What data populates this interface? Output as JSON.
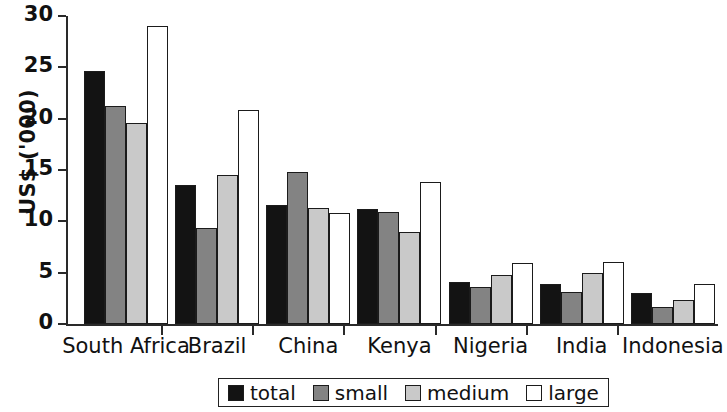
{
  "chart_data": {
    "type": "bar",
    "title": "",
    "subtitle": "",
    "xlabel": "",
    "ylabel": "US$  ('000)",
    "ylim": [
      0,
      30
    ],
    "yticks": [
      0,
      5,
      10,
      15,
      20,
      25,
      30
    ],
    "ytick_labels": [
      "0",
      "5",
      "10",
      "15",
      "20",
      "25",
      "30"
    ],
    "grid": false,
    "legend_position": "bottom-center",
    "categories": [
      "South Africa",
      "Brazil",
      "China",
      "Kenya",
      "Nigeria",
      "India",
      "Indonesia"
    ],
    "series": [
      {
        "name": "total",
        "color": "#131313",
        "values": [
          24.6,
          13.5,
          11.6,
          11.2,
          4.1,
          3.9,
          3.0
        ]
      },
      {
        "name": "small",
        "color": "#838383",
        "values": [
          21.2,
          9.4,
          14.8,
          10.9,
          3.6,
          3.1,
          1.7
        ]
      },
      {
        "name": "medium",
        "color": "#c9c9c9",
        "values": [
          19.6,
          14.5,
          11.3,
          9.0,
          4.8,
          5.0,
          2.3
        ]
      },
      {
        "name": "large",
        "color": "#ffffff",
        "values": [
          29.0,
          20.8,
          10.8,
          13.8,
          5.9,
          6.0,
          3.9
        ]
      }
    ],
    "legend": [
      "total",
      "small",
      "medium",
      "large"
    ]
  }
}
